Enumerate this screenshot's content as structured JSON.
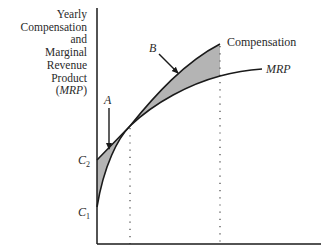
{
  "diagram": {
    "y_axis_label_lines": [
      "Yearly",
      "Compensation",
      "and",
      "Marginal",
      "Revenue",
      "Product"
    ],
    "y_axis_label_abbrev": "MRP",
    "curve_labels": {
      "compensation": "Compensation",
      "mrp": "MRP"
    },
    "point_labels": {
      "a": "A",
      "b": "B"
    },
    "y_ticks": {
      "c2_base": "C",
      "c2_sub": "2",
      "c1_base": "C",
      "c1_sub": "1"
    },
    "colors": {
      "line": "#1a1a1a",
      "shade": "#b4b4b4",
      "dotted": "#555555"
    }
  }
}
